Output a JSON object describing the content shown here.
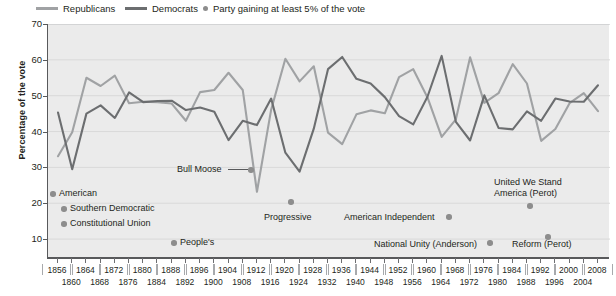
{
  "legend": {
    "republicans": {
      "label": "Republicans",
      "color": "#a0a2a4",
      "icon": "line-swatch-icon"
    },
    "democrats": {
      "label": "Democrats",
      "color": "#6c6e70",
      "icon": "line-swatch-icon"
    },
    "gaining": {
      "label": "Party gaining at least 5% of the vote",
      "color": "#8d8d8d",
      "icon": "dot-marker-icon"
    }
  },
  "axes": {
    "ylabel": "Percentage of the vote",
    "yticks": [
      10,
      20,
      30,
      40,
      50,
      60,
      70
    ],
    "ylim": [
      5,
      70
    ],
    "xlim": [
      1856,
      2008
    ],
    "xticks_top": [
      1856,
      1864,
      1872,
      1880,
      1888,
      1896,
      1904,
      1912,
      1920,
      1928,
      1936,
      1944,
      1952,
      1960,
      1968,
      1976,
      1984,
      1992,
      2000,
      2008
    ],
    "xticks_bottom": [
      1860,
      1868,
      1876,
      1884,
      1892,
      1900,
      1908,
      1916,
      1924,
      1932,
      1940,
      1948,
      1956,
      1964,
      1972,
      1980,
      1988,
      1996,
      2004
    ]
  },
  "chart_data": {
    "type": "line",
    "title": "",
    "xlabel": "",
    "ylabel": "Percentage of the vote",
    "ylim": [
      5,
      70
    ],
    "xlim": [
      1856,
      2008
    ],
    "grid": true,
    "legend_position": "top",
    "x": [
      1856,
      1860,
      1864,
      1868,
      1872,
      1876,
      1880,
      1884,
      1888,
      1892,
      1896,
      1900,
      1904,
      1908,
      1912,
      1916,
      1920,
      1924,
      1928,
      1932,
      1936,
      1940,
      1944,
      1948,
      1952,
      1956,
      1960,
      1964,
      1968,
      1972,
      1976,
      1980,
      1984,
      1988,
      1992,
      1996,
      2000,
      2004,
      2008
    ],
    "series": [
      {
        "name": "Republicans",
        "color": "#a0a2a4",
        "values": [
          33.1,
          39.8,
          55.0,
          52.7,
          55.6,
          47.9,
          48.3,
          48.2,
          47.8,
          43.0,
          51.0,
          51.6,
          56.4,
          51.6,
          23.2,
          46.1,
          60.3,
          54.0,
          58.2,
          39.7,
          36.5,
          44.8,
          45.9,
          45.1,
          55.2,
          57.4,
          49.5,
          38.5,
          43.4,
          60.7,
          48.0,
          50.7,
          58.8,
          53.4,
          37.4,
          40.7,
          47.9,
          50.7,
          45.7
        ]
      },
      {
        "name": "Democrats",
        "color": "#6c6e70",
        "values": [
          45.3,
          29.5,
          45.0,
          47.3,
          43.8,
          50.9,
          48.2,
          48.5,
          48.6,
          46.0,
          46.7,
          45.5,
          37.6,
          43.0,
          41.8,
          49.2,
          34.1,
          28.8,
          40.8,
          57.4,
          60.8,
          54.7,
          53.4,
          49.6,
          44.3,
          42.0,
          49.7,
          61.1,
          42.7,
          37.5,
          50.1,
          41.0,
          40.6,
          45.6,
          43.0,
          49.2,
          48.4,
          48.3,
          52.9
        ]
      }
    ],
    "third_party_points": [
      {
        "label": "American",
        "year": 1856,
        "value": 21.5
      },
      {
        "label": "Southern Democratic",
        "year": 1860,
        "value": 18.1
      },
      {
        "label": "Constitutional Union",
        "year": 1860,
        "value": 12.6
      },
      {
        "label": "People's",
        "year": 1892,
        "value": 8.5
      },
      {
        "label": "Bull Moose",
        "year": 1912,
        "value": 27.4
      },
      {
        "label": "Progressive",
        "year": 1924,
        "value": 16.6
      },
      {
        "label": "American Independent",
        "year": 1968,
        "value": 13.5
      },
      {
        "label": "National Unity (Anderson)",
        "year": 1980,
        "value": 6.6
      },
      {
        "label": "United We Stand America (Perot)",
        "year": 1992,
        "value": 18.9
      },
      {
        "label": "Reform (Perot)",
        "year": 1996,
        "value": 8.4
      }
    ]
  },
  "annotations": [
    {
      "name": "american",
      "text": "American",
      "left": 59,
      "top": 188,
      "dot_left": 50,
      "dot_top": 191
    },
    {
      "name": "southern-democratic",
      "text": "Southern Democratic",
      "left": 70,
      "top": 203,
      "dot_left": 61,
      "dot_top": 206
    },
    {
      "name": "constitutional-union",
      "text": "Constitutional Union",
      "left": 70,
      "top": 218,
      "dot_left": 61,
      "dot_top": 221
    },
    {
      "name": "peoples",
      "text": "People's",
      "left": 180,
      "top": 237,
      "dot_left": 171,
      "dot_top": 240
    },
    {
      "name": "bull-moose",
      "text": "Bull Moose",
      "left": 177,
      "top": 164,
      "dot_left": 248,
      "dot_top": 167
    },
    {
      "name": "progressive",
      "text": "Progressive",
      "left": 264,
      "top": 212,
      "dot_left": 288,
      "dot_top": 199
    },
    {
      "name": "american-independent",
      "text": "American Independent",
      "left": 344,
      "top": 212,
      "dot_left": 446,
      "dot_top": 214
    },
    {
      "name": "national-unity",
      "text": "National Unity (Anderson)",
      "left": 374,
      "top": 239,
      "dot_left": 487,
      "dot_top": 240
    },
    {
      "name": "reform-perot",
      "text": "Reform (Perot)",
      "left": 512,
      "top": 239,
      "dot_left": 545,
      "dot_top": 234
    },
    {
      "name": "united-we-stand-1",
      "text": "United We Stand",
      "left": 494,
      "top": 177,
      "dot_left": null,
      "dot_top": null
    },
    {
      "name": "united-we-stand-2",
      "text": "America (Perot)",
      "left": 494,
      "top": 188,
      "dot_left": 527,
      "dot_top": 203
    }
  ]
}
